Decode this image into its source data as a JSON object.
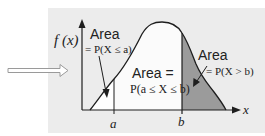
{
  "diagram": {
    "title": "",
    "y_axis_label": "f (x)",
    "x_axis_label": "x",
    "tick_a": "a",
    "tick_b": "b",
    "left_region": {
      "title": "Area",
      "formula": "= P(X ≤ a)"
    },
    "middle_region": {
      "title": "Area =",
      "formula": "P(a ≤ X ≤ b)"
    },
    "right_region": {
      "title": "Area",
      "formula": "= P(X > b)"
    },
    "colors": {
      "panel_background": "#ececec",
      "curve_fill": "#fbfbfb",
      "tail_fill": "#9b9b9b",
      "stroke": "#1e1e1e",
      "pointer_arrow": "#9a9a9a"
    }
  }
}
